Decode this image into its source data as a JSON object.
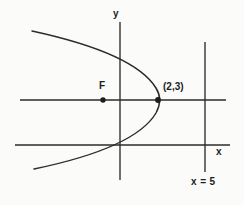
{
  "figure": {
    "kind": "parabola-diagram",
    "background_color": "#fbfbf9",
    "ink_color": "#2b2b2b",
    "labels": {
      "y_axis": "y",
      "x_axis": "x",
      "focus": "F",
      "vertex_point": "(2,3)",
      "directrix": "x = 5"
    }
  },
  "chart_data": {
    "type": "scatter",
    "title": "",
    "xlabel": "x",
    "ylabel": "y",
    "grid": false,
    "legend": null,
    "annotations": [
      {
        "name": "focus",
        "text": "F",
        "x_px": 103,
        "y_px": 100
      },
      {
        "name": "vertex",
        "text": "(2,3)",
        "x_px": 158,
        "y_px": 100
      },
      {
        "name": "directrix",
        "text": "x = 5",
        "x_px": 205,
        "y_px": 185
      }
    ],
    "elements": [
      {
        "name": "y-axis",
        "orientation": "vertical",
        "x_px": 120,
        "y_from_px": 22,
        "y_to_px": 180
      },
      {
        "name": "x-axis",
        "orientation": "horizontal",
        "y_px": 145,
        "x_from_px": 15,
        "x_to_px": 230
      },
      {
        "name": "axis-of-symmetry",
        "orientation": "horizontal",
        "y_px": 100,
        "x_from_px": 20,
        "x_to_px": 226
      },
      {
        "name": "directrix",
        "orientation": "vertical",
        "x_px": 205,
        "y_from_px": 42,
        "y_to_px": 172
      },
      {
        "name": "parabola",
        "opens": "left",
        "vertex_px": [
          158,
          100
        ],
        "focus_px": [
          103,
          100
        ]
      }
    ],
    "points": [
      {
        "label": "F",
        "x_px": 103,
        "y_px": 100,
        "role": "focus"
      },
      {
        "label": "(2,3)",
        "x_px": 158,
        "y_px": 100,
        "role": "vertex"
      }
    ],
    "curve_path": "M 32 31 C 92 44, 140 62, 156 88 C 161 96, 161 104, 156 113 C 140 140, 92 157, 34 169"
  }
}
